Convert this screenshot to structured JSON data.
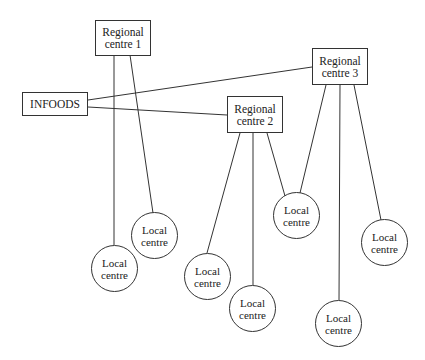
{
  "diagram": {
    "nodes": {
      "infoods": {
        "label": "INFOODS"
      },
      "rc1": {
        "line1": "Regional",
        "line2": "centre 1"
      },
      "rc2": {
        "line1": "Regional",
        "line2": "centre 2"
      },
      "rc3": {
        "line1": "Regional",
        "line2": "centre 3"
      },
      "local": [
        {
          "line1": "Local",
          "line2": "centre"
        },
        {
          "line1": "Local",
          "line2": "centre"
        },
        {
          "line1": "Local",
          "line2": "centre"
        },
        {
          "line1": "Local",
          "line2": "centre"
        },
        {
          "line1": "Local",
          "line2": "centre"
        },
        {
          "line1": "Local",
          "line2": "centre"
        },
        {
          "line1": "Local",
          "line2": "centre"
        }
      ]
    },
    "edges": [
      [
        "infoods",
        "rc3"
      ],
      [
        "infoods",
        "rc2"
      ],
      [
        "rc1",
        "local0"
      ],
      [
        "rc1",
        "local1"
      ],
      [
        "rc2",
        "local2"
      ],
      [
        "rc2",
        "local3"
      ],
      [
        "rc2",
        "local4"
      ],
      [
        "rc3",
        "local4"
      ],
      [
        "rc3",
        "local5"
      ],
      [
        "rc3",
        "local6"
      ]
    ]
  }
}
